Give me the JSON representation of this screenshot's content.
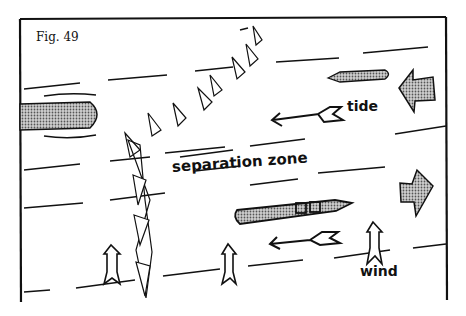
{
  "figure": {
    "label": "Fig. 49",
    "labels": {
      "separation_zone": "separation zone",
      "tide": "tide",
      "wind": "wind"
    },
    "colors": {
      "ink": "#111111",
      "shade": "#9a9a9a",
      "paper": "#ffffff"
    }
  }
}
